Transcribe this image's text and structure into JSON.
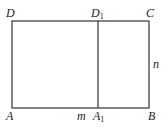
{
  "diagram": {
    "type": "rectangle-partition",
    "line_color": "#333333",
    "background": "#ffffff",
    "rectangle": {
      "left": 12,
      "top": 21,
      "right": 149,
      "bottom": 108
    },
    "divider_x": 98,
    "points": {
      "D": {
        "label": "D",
        "sub": "",
        "x": 6,
        "y": 17
      },
      "D1": {
        "label": "D",
        "sub": "1",
        "x": 91,
        "y": 17
      },
      "C": {
        "label": "C",
        "sub": "",
        "x": 146,
        "y": 17
      },
      "A": {
        "label": "A",
        "sub": "",
        "x": 6,
        "y": 120
      },
      "A1": {
        "label": "A",
        "sub": "1",
        "x": 93,
        "y": 120
      },
      "B": {
        "label": "B",
        "sub": "",
        "x": 148,
        "y": 120
      }
    },
    "segment_labels": {
      "m": {
        "label": "m",
        "x": 77,
        "y": 120
      },
      "n": {
        "label": "n",
        "x": 153,
        "y": 68
      }
    }
  }
}
